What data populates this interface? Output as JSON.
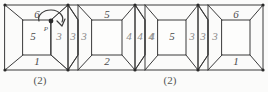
{
  "figure": {
    "stroke_color": "#3a3a3a",
    "faint_stroke_color": "#6d6d6d",
    "number_color": "#4a4a4a",
    "faint_number_color": "#8c8c8c",
    "background_color": "#fbfbfa"
  },
  "cubes": [
    {
      "index": 1,
      "top": "6",
      "front": "5",
      "right": "3",
      "bottom": "1"
    },
    {
      "index": 2,
      "top": "5",
      "left": "3",
      "right": "4",
      "bottom": "2"
    },
    {
      "index": 3,
      "top": "",
      "left": "4",
      "front": "5",
      "right": "3",
      "bottom": ""
    },
    {
      "index": 4,
      "top": "6",
      "left": "3",
      "bottom": "1"
    }
  ],
  "seams": [
    {
      "index": 1,
      "left_face": "3",
      "right_face": "3"
    },
    {
      "index": 2,
      "left_face": "4",
      "right_face": "4"
    },
    {
      "index": 3,
      "left_face": "3",
      "right_face": "3"
    }
  ],
  "annotations": {
    "point_label": "P",
    "rotation_arrow": "curved-arrow-clockwise"
  },
  "captions": [
    {
      "index": 1,
      "text": "(2)"
    },
    {
      "index": 2,
      "text": "(2)"
    }
  ]
}
